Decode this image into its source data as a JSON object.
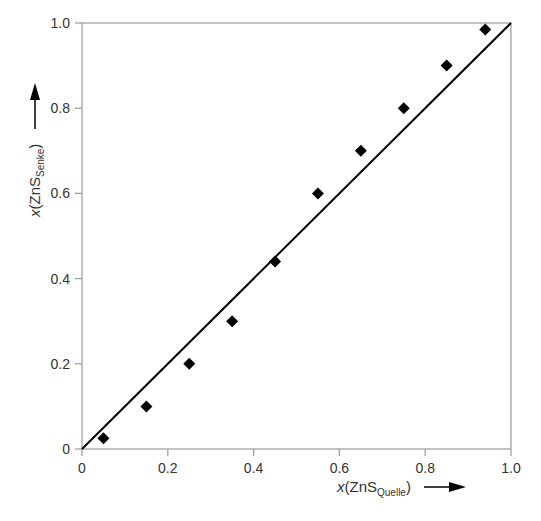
{
  "chart_data": {
    "type": "scatter",
    "title": "",
    "xlabel": {
      "prefix": "x",
      "species": "ZnS",
      "subscript": "Quelle"
    },
    "ylabel": {
      "prefix": "x",
      "species": "ZnS",
      "subscript": "Senke"
    },
    "xlim": [
      0,
      1.0
    ],
    "ylim": [
      0,
      1.0
    ],
    "x_ticks": [
      "0",
      "0.2",
      "0.4",
      "0.6",
      "0.8",
      "1.0"
    ],
    "y_ticks": [
      "0",
      "0.2",
      "0.4",
      "0.6",
      "0.8",
      "1.0"
    ],
    "grid": false,
    "legend": null,
    "series": [
      {
        "name": "measured",
        "marker": "diamond",
        "color": "#000000",
        "x": [
          0.05,
          0.15,
          0.25,
          0.35,
          0.45,
          0.55,
          0.65,
          0.75,
          0.85,
          0.94
        ],
        "y": [
          0.025,
          0.1,
          0.2,
          0.3,
          0.44,
          0.6,
          0.7,
          0.8,
          0.9,
          0.985
        ]
      },
      {
        "name": "diagonal",
        "type": "line",
        "color": "#000000",
        "x": [
          0,
          1.0
        ],
        "y": [
          0,
          1.0
        ]
      }
    ]
  },
  "labels": {
    "x_prefix": "x",
    "x_species": "(ZnS",
    "x_sub": "Quelle",
    "x_close": ")",
    "y_prefix": "x",
    "y_species": "(ZnS",
    "y_sub": "Senke",
    "y_close": ")"
  }
}
